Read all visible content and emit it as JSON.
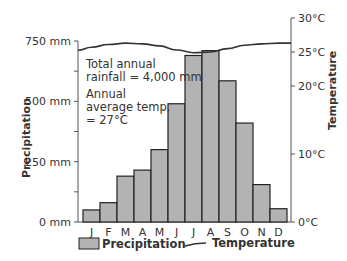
{
  "chart_data": {
    "type": "bar",
    "title": "",
    "categories": [
      "J",
      "F",
      "M",
      "A",
      "M",
      "J",
      "J",
      "A",
      "S",
      "O",
      "N",
      "D"
    ],
    "series": [
      {
        "name": "Precipitation",
        "type": "bar",
        "axis": "left",
        "unit": "mm",
        "values": [
          50,
          80,
          190,
          215,
          300,
          490,
          690,
          710,
          585,
          410,
          155,
          55
        ]
      },
      {
        "name": "Temperature",
        "type": "line",
        "axis": "right",
        "unit": "°C",
        "values": [
          25.7,
          26.1,
          26.3,
          26.2,
          25.9,
          25.3,
          24.9,
          25.0,
          25.5,
          26.0,
          26.2,
          26.3
        ]
      }
    ],
    "xlabel": "",
    "ylabel": "Precipitation",
    "ylabel_right": "Temperature",
    "ylim": [
      0,
      750
    ],
    "ylim_right": [
      0,
      30
    ],
    "yticks": [
      "0 mm",
      "250 mm",
      "500 mm",
      "750 mm"
    ],
    "yticks_right": [
      "0°C",
      "10°C",
      "20°C",
      "25°C",
      "30°C"
    ],
    "annotations": [
      "Total annual rainfall = 4,000 mm",
      "Annual average temp. = 27°C"
    ],
    "legend": [
      "Precipitation",
      "Temperature"
    ],
    "legend_position": "bottom",
    "grid": false
  },
  "labels": {
    "y_left": "Precipitation",
    "y_right": "Temperature",
    "annotation_line1": "Total annual",
    "annotation_line2": "rainfall = 4,000 mm",
    "annotation_line3": "Annual",
    "annotation_line4": "average temp.",
    "annotation_line5": "= 27°C",
    "legend_precip": "Precipitation",
    "legend_temp": "Temperature"
  },
  "colors": {
    "bar": "#b3b3b3",
    "bar_stroke": "#222222",
    "axis": "#555555",
    "line": "#333333"
  }
}
